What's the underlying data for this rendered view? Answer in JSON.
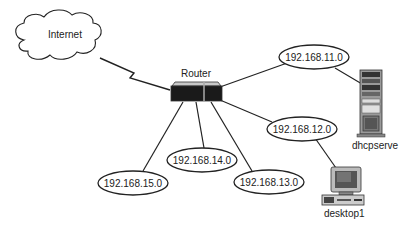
{
  "diagram": {
    "cloud": {
      "label": "Internet"
    },
    "router": {
      "label": "Router"
    },
    "networks": [
      {
        "id": "net11",
        "label": "192.168.11.0"
      },
      {
        "id": "net12",
        "label": "192.168.12.0"
      },
      {
        "id": "net13",
        "label": "192.168.13.0"
      },
      {
        "id": "net14",
        "label": "192.168.14.0"
      },
      {
        "id": "net15",
        "label": "192.168.15.0"
      }
    ],
    "server": {
      "label": "dhcpserve"
    },
    "workstation": {
      "label": "desktop1"
    },
    "links": [
      {
        "from": "Internet",
        "to": "Router",
        "type": "wan-lightning"
      },
      {
        "from": "Router",
        "to": "192.168.11.0"
      },
      {
        "from": "Router",
        "to": "192.168.12.0"
      },
      {
        "from": "Router",
        "to": "192.168.13.0"
      },
      {
        "from": "Router",
        "to": "192.168.14.0"
      },
      {
        "from": "Router",
        "to": "192.168.15.0"
      },
      {
        "from": "192.168.11.0",
        "to": "dhcpserve"
      },
      {
        "from": "192.168.12.0",
        "to": "desktop1"
      }
    ],
    "colors": {
      "line": "#222222",
      "ellipse_fill": "#ffffff",
      "router_body": "#1a1a1a",
      "router_top": "#bfbfbf"
    }
  }
}
